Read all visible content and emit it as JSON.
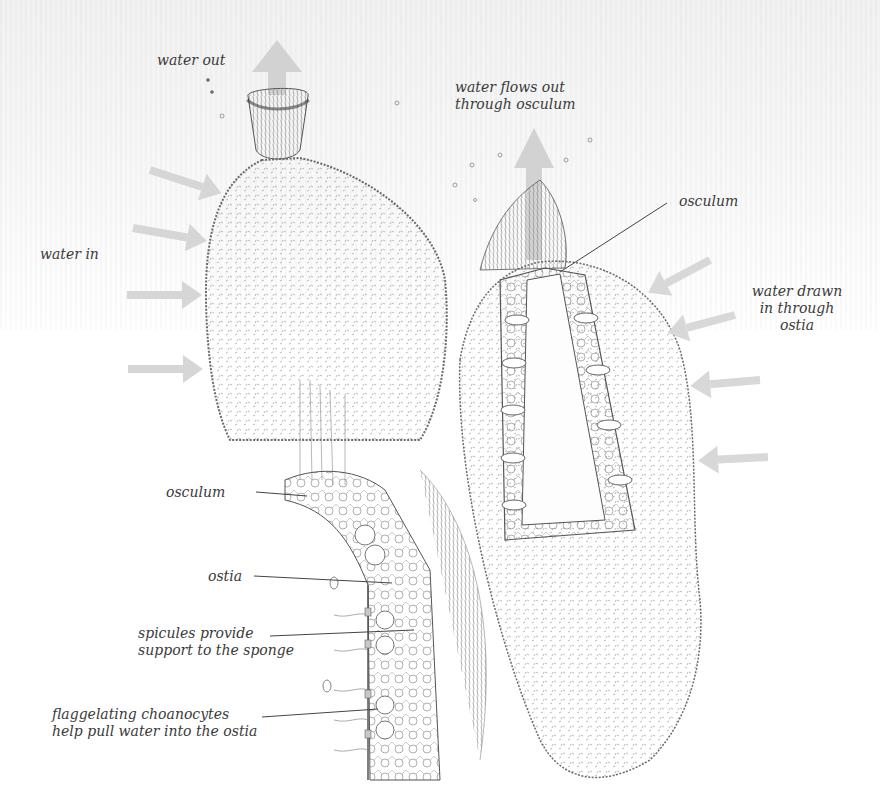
{
  "diagram": {
    "colors": {
      "background_top": "#f3f3f3",
      "background": "#ffffff",
      "arrow": "#d4d4d4",
      "ink": "#3a3a3a",
      "sketch": "#6a6a6a"
    },
    "labels": {
      "water_out": "water out",
      "water_in": "water in",
      "water_flows_out_line1": "water flows out",
      "water_flows_out_line2": "through osculum",
      "osculum_right": "osculum",
      "water_drawn_line1": "water drawn",
      "water_drawn_line2": "in through",
      "water_drawn_line3": "ostia",
      "osculum_detail": "osculum",
      "ostia_detail": "ostia",
      "spicules_line1": "spicules provide",
      "spicules_line2": "support to the sponge",
      "choanocytes_line1": "flaggelating choanocytes",
      "choanocytes_line2": "help pull water into the ostia"
    },
    "figures": [
      {
        "name": "whole-sponge",
        "description": "exterior view of vase-shaped sponge"
      },
      {
        "name": "sponge-cross-section",
        "description": "cut-away view showing canals and ostia"
      },
      {
        "name": "body-wall-detail",
        "description": "magnified cell detail of the sponge wall"
      }
    ],
    "arrows": {
      "water_in_count": 4,
      "water_drawn_in_count": 4,
      "water_out_count": 2
    }
  }
}
